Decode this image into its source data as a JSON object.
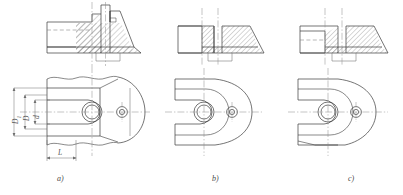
{
  "drawing": {
    "title": "Fork-end connection section and plan views",
    "background_color": "#ffffff",
    "line_color": "#3a3a3a",
    "thin_line_color": "#6e6e6e",
    "center_line_color": "#7a7a7a",
    "hatch_color": "#4a4a4a"
  },
  "figures": [
    {
      "id": "a",
      "caption": "a)",
      "section_view": "hatched sectional elevation with stepped boss and tapered right flank",
      "plan_view": "U-shaped fork plan with break lines top and bottom"
    },
    {
      "id": "b",
      "caption": "b)",
      "section_view": "hatched sectional elevation with plain left block and tapered right flank",
      "plan_view": "U-shaped fork plan, full outline"
    },
    {
      "id": "c",
      "caption": "c)",
      "section_view": "hatched sectional elevation with recessed left pocket and tapered right flank",
      "plan_view": "U-shaped fork plan, full outline"
    }
  ],
  "dimensions": [
    {
      "name": "D1",
      "label": "D",
      "subscript": "1",
      "orientation": "vertical",
      "figure": "a"
    },
    {
      "name": "D",
      "label": "D",
      "subscript": "",
      "orientation": "vertical",
      "figure": "a"
    },
    {
      "name": "d",
      "label": "d",
      "subscript": "",
      "orientation": "vertical",
      "figure": "a"
    },
    {
      "name": "L",
      "label": "L",
      "subscript": "",
      "orientation": "horizontal",
      "figure": "a"
    }
  ]
}
